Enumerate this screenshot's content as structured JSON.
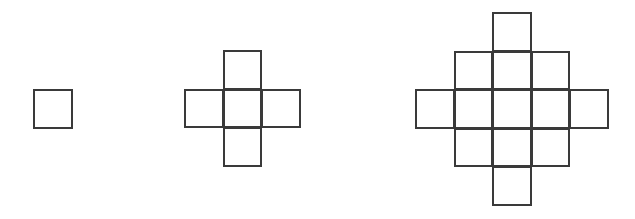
{
  "diagram": {
    "cell_size": 38.5,
    "line_color": "#3a3a3a",
    "figures": [
      {
        "label": "figure-1",
        "square_count": 1,
        "origin": [
          33,
          89
        ],
        "cells": [
          [
            0,
            0
          ]
        ]
      },
      {
        "label": "figure-2",
        "square_count": 5,
        "origin": [
          184,
          50
        ],
        "cells": [
          [
            1,
            0
          ],
          [
            0,
            1
          ],
          [
            1,
            1
          ],
          [
            2,
            1
          ],
          [
            1,
            2
          ]
        ]
      },
      {
        "label": "figure-3",
        "square_count": 13,
        "origin": [
          415,
          12
        ],
        "cells": [
          [
            2,
            0
          ],
          [
            1,
            1
          ],
          [
            2,
            1
          ],
          [
            3,
            1
          ],
          [
            0,
            2
          ],
          [
            1,
            2
          ],
          [
            2,
            2
          ],
          [
            3,
            2
          ],
          [
            4,
            2
          ],
          [
            1,
            3
          ],
          [
            2,
            3
          ],
          [
            3,
            3
          ],
          [
            2,
            4
          ]
        ]
      }
    ]
  }
}
